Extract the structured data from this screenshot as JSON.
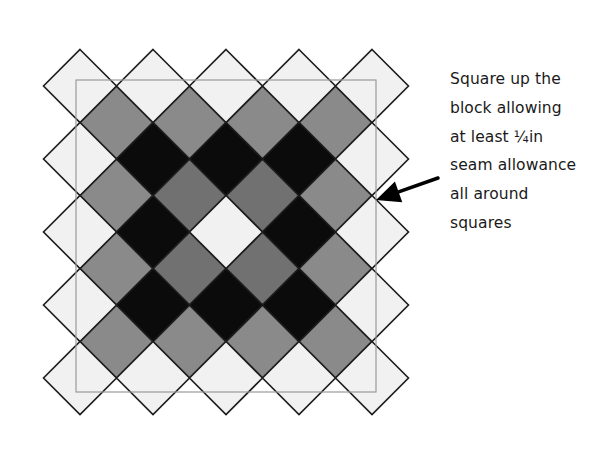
{
  "diagram": {
    "type": "quilt-block-on-point",
    "lattice": {
      "major": {
        "origin": [
          80,
          86
        ],
        "step": 73,
        "count": [
          5,
          5
        ],
        "half_diagonal": 36.5,
        "pattern": [
          [
            "light",
            "light",
            "light",
            "light",
            "light"
          ],
          [
            "light",
            "black",
            "black",
            "black",
            "light"
          ],
          [
            "light",
            "black",
            "light",
            "black",
            "light"
          ],
          [
            "light",
            "black",
            "black",
            "black",
            "light"
          ],
          [
            "light",
            "light",
            "light",
            "light",
            "light"
          ]
        ]
      },
      "minor": {
        "origin": [
          116.5,
          122.5
        ],
        "step": 73,
        "count": [
          4,
          4
        ],
        "half_diagonal": 36.5,
        "pattern": [
          [
            "gray",
            "gray",
            "gray",
            "gray"
          ],
          [
            "gray",
            "dark_gray",
            "dark_gray",
            "gray"
          ],
          [
            "gray",
            "dark_gray",
            "dark_gray",
            "gray"
          ],
          [
            "gray",
            "gray",
            "gray",
            "gray"
          ]
        ]
      }
    },
    "colors": {
      "light": "#f1f1f1",
      "gray": "#8a8a8a",
      "dark_gray": "#717171",
      "black": "#0b0b0b",
      "outline": "#1c1c1c",
      "trim_frame": "#9a9a9a"
    },
    "trim_frame": {
      "x": 76,
      "y": 80,
      "width": 300,
      "height": 312
    },
    "arrow": {
      "from": [
        438,
        178
      ],
      "to": [
        376,
        200
      ],
      "color": "#000000"
    }
  },
  "caption": {
    "lines": [
      "Square up the",
      "block allowing",
      "at least ¼in",
      "seam allowance",
      "all around",
      "squares"
    ]
  }
}
